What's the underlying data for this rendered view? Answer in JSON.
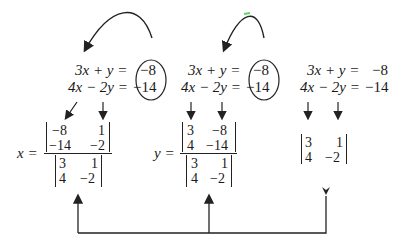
{
  "systems": [
    {
      "eq1_lhs": "3x + y =",
      "eq1_rhs": "−8",
      "eq2_lhs": "4x − 2y =",
      "eq2_rhs": "−14",
      "constants_circled": true
    },
    {
      "eq1_lhs": "3x + y =",
      "eq1_rhs": "−8",
      "eq2_lhs": "4x − 2y =",
      "eq2_rhs": "−14",
      "constants_circled": true
    },
    {
      "eq1_lhs": "3x + y =",
      "eq1_rhs": "−8",
      "eq2_lhs": "4x − 2y =",
      "eq2_rhs": "−14",
      "constants_circled": false
    }
  ],
  "x_solution": {
    "label": "x =",
    "numerator": [
      [
        "−8",
        "1"
      ],
      [
        "−14",
        "−2"
      ]
    ],
    "denominator": [
      [
        "3",
        "1"
      ],
      [
        "4",
        "−2"
      ]
    ]
  },
  "y_solution": {
    "label": "y =",
    "numerator": [
      [
        "3",
        "−8"
      ],
      [
        "4",
        "−14"
      ]
    ],
    "denominator": [
      [
        "3",
        "1"
      ],
      [
        "4",
        "−2"
      ]
    ]
  },
  "coefficient_determinant": [
    [
      "3",
      "1"
    ],
    [
      "4",
      "−2"
    ]
  ],
  "colors": {
    "ink": "#1a1a1a",
    "accent_dot": "#5fd35f"
  }
}
